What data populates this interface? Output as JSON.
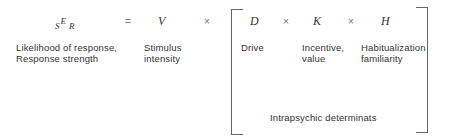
{
  "equation": {
    "lhs": {
      "prefix": "S",
      "main": "E",
      "suffix": "R"
    },
    "equals": "=",
    "terms": [
      {
        "symbol": "V",
        "label_line1": "Stimulus",
        "label_line2": "intensity"
      },
      {
        "symbol": "D",
        "label_line1": "Drive",
        "label_line2": ""
      },
      {
        "symbol": "K",
        "label_line1": "Incentive,",
        "label_line2": "value"
      },
      {
        "symbol": "H",
        "label_line1": "Habitualization",
        "label_line2": "familiarity"
      }
    ],
    "times": "×",
    "lhs_label_line1": "Likelihood of response,",
    "lhs_label_line2": "Response strength",
    "bracket_label": "Intrapsychic determinats"
  }
}
